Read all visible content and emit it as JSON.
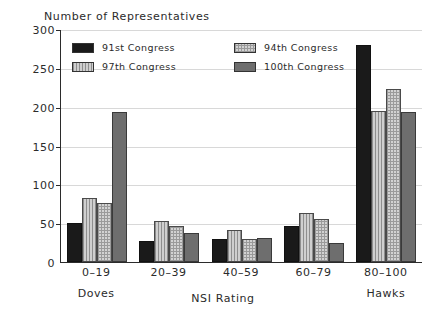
{
  "chart_data": {
    "type": "bar",
    "title": "",
    "ylabel": "Number of Representatives",
    "xlabel": "NSI Rating",
    "categories": [
      "0–19",
      "20–39",
      "40–59",
      "60–79",
      "80–100"
    ],
    "category_annotations": [
      "Doves",
      "",
      "",
      "",
      "Hawks"
    ],
    "series": [
      {
        "name": "91st Congress",
        "values": [
          50,
          27,
          29,
          46,
          280
        ],
        "color": "#1a1a1a",
        "pattern": "solid-black"
      },
      {
        "name": "97th Congress",
        "values": [
          82,
          53,
          41,
          63,
          194
        ],
        "color": "#b5b5b5",
        "pattern": "vertical-hatch"
      },
      {
        "name": "94th Congress",
        "values": [
          76,
          47,
          30,
          56,
          223
        ],
        "color": "#d2d2d2",
        "pattern": "grid-hatch"
      },
      {
        "name": "100th Congress",
        "values": [
          193,
          38,
          31,
          25,
          193
        ],
        "color": "#6e6e6e",
        "pattern": "solid-gray"
      }
    ],
    "ylim": [
      0,
      300
    ],
    "yticks": [
      0,
      50,
      100,
      150,
      200,
      250,
      300
    ],
    "ytick_labels": [
      "0",
      "50",
      "100",
      "150",
      "200",
      "250",
      "300"
    ],
    "grid": true,
    "legend_position": "upper-left-inside",
    "legend_order": [
      "91st Congress",
      "94th Congress",
      "97th Congress",
      "100th Congress"
    ],
    "bar_order_in_group": [
      "91st Congress",
      "97th Congress",
      "94th Congress",
      "100th Congress"
    ]
  },
  "legend": {
    "entries": [
      {
        "label": "91st Congress",
        "series_index": 0
      },
      {
        "label": "94th Congress",
        "series_index": 2
      },
      {
        "label": "97th Congress",
        "series_index": 1
      },
      {
        "label": "100th Congress",
        "series_index": 3
      }
    ]
  }
}
